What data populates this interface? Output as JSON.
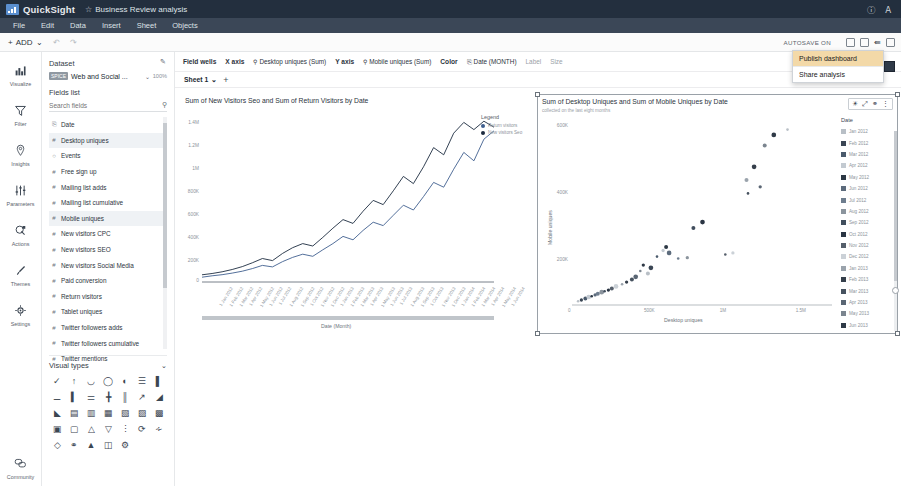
{
  "app": {
    "brand": "QuickSight",
    "doc_title": "Business Review analysis",
    "star_icon": "star-icon",
    "help_icon": "help-icon",
    "account_icon": "account-icon"
  },
  "menubar": {
    "items": [
      {
        "label": "File"
      },
      {
        "label": "Edit"
      },
      {
        "label": "Data"
      },
      {
        "label": "Insert"
      },
      {
        "label": "Sheet"
      },
      {
        "label": "Objects"
      }
    ]
  },
  "toolbar": {
    "add_label": "ADD",
    "add_caret": "⌄",
    "undo_icon": "undo-icon",
    "redo_icon": "redo-icon",
    "autosave_label": "AUTOSAVE ON",
    "icons": [
      "history-icon",
      "pdf-export-icon",
      "share-icon",
      "fullscreen-icon"
    ]
  },
  "share_menu": {
    "items": [
      {
        "label": "Publish dashboard",
        "highlighted": true
      },
      {
        "label": "Share analysis",
        "highlighted": false
      }
    ]
  },
  "rail": {
    "items": [
      {
        "label": "Visualize",
        "icon": "bar-chart-icon",
        "glyph": "ὌA"
      },
      {
        "label": "Filter",
        "icon": "funnel-icon",
        "glyph": "▽"
      },
      {
        "label": "Insights",
        "icon": "lightbulb-pin-icon",
        "glyph": "⦸"
      },
      {
        "label": "Parameters",
        "icon": "sliders-icon",
        "glyph": "⦀"
      },
      {
        "label": "Actions",
        "icon": "cursor-click-icon",
        "glyph": "⊕"
      },
      {
        "label": "Themes",
        "icon": "paintbrush-icon",
        "glyph": "✐"
      },
      {
        "label": "Settings",
        "icon": "gear-icon",
        "glyph": "⚙"
      }
    ],
    "bottom": {
      "label": "Community",
      "icon": "chat-bubbles-icon",
      "glyph": "὞9"
    }
  },
  "panel": {
    "dataset_header": "Dataset",
    "edit_icon": "pencil-icon",
    "dataset_badge": "SPICE",
    "dataset_name": "Web and Social ...",
    "dataset_caret": "⌄",
    "dataset_pct": "100%",
    "fields_header": "Fields list",
    "search_placeholder": "Search fields",
    "search_icon": "search-icon",
    "fields": [
      {
        "label": "Date",
        "type": "date",
        "glyph": "Ὄ5",
        "selected": false
      },
      {
        "label": "Desktop uniques",
        "type": "number",
        "glyph": "#",
        "selected": true
      },
      {
        "label": "Events",
        "type": "string",
        "glyph": "○",
        "selected": false
      },
      {
        "label": "Free sign up",
        "type": "number",
        "glyph": "#",
        "selected": false
      },
      {
        "label": "Mailing list adds",
        "type": "number",
        "glyph": "#",
        "selected": false
      },
      {
        "label": "Mailing list cumulative",
        "type": "number",
        "glyph": "#",
        "selected": false
      },
      {
        "label": "Mobile uniques",
        "type": "number",
        "glyph": "#",
        "selected": true
      },
      {
        "label": "New visitors CPC",
        "type": "number",
        "glyph": "#",
        "selected": false
      },
      {
        "label": "New visitors SEO",
        "type": "number",
        "glyph": "#",
        "selected": false
      },
      {
        "label": "New visitors Social Media",
        "type": "number",
        "glyph": "#",
        "selected": false
      },
      {
        "label": "Paid conversion",
        "type": "number",
        "glyph": "#",
        "selected": false
      },
      {
        "label": "Return visitors",
        "type": "number",
        "glyph": "#",
        "selected": false
      },
      {
        "label": "Tablet uniques",
        "type": "number",
        "glyph": "#",
        "selected": false
      },
      {
        "label": "Twitter followers adds",
        "type": "number",
        "glyph": "#",
        "selected": false
      },
      {
        "label": "Twitter followers cumulative",
        "type": "number",
        "glyph": "#",
        "selected": false
      },
      {
        "label": "Twitter mentions",
        "type": "number",
        "glyph": "#",
        "selected": false
      },
      {
        "label": "Website Pageviews",
        "type": "number",
        "glyph": "#",
        "selected": false
      }
    ],
    "visual_types_header": "Visual types",
    "visual_types_caret": "⌄",
    "visual_type_icons": [
      "autograph-icon",
      "kpi-icon",
      "area-line-icon",
      "pie-icon",
      "donut-icon",
      "bar-horizontal-icon",
      "bar-vertical-icon",
      "bar-stacked-h-icon",
      "bar-stacked-v-icon",
      "bar-100-h-icon",
      "bar-clustered-icon",
      "bar-grouped-icon",
      "line-icon",
      "area-icon",
      "area-stacked-icon",
      "combo-icon",
      "combo-stacked-icon",
      "histogram-icon",
      "pivot-table-icon",
      "table-icon",
      "heat-map-icon",
      "tree-map-icon",
      "geospatial-icon",
      "funnel-icon",
      "funnel-chart-icon",
      "scatter-icon",
      "gauge-icon",
      "word-cloud-icon",
      "sankey-icon",
      "insight-icon",
      "filled-map-icon",
      "box-plot-icon",
      "radar-icon"
    ]
  },
  "field_wells": {
    "title": "Field wells",
    "wells": [
      {
        "label": "X axis",
        "value": "Desktop uniques (Sum)",
        "icon": "number-field-icon"
      },
      {
        "label": "Y axis",
        "value": "Mobile uniques (Sum)",
        "icon": "number-field-icon"
      },
      {
        "label": "Color",
        "value": "Date (MONTH)",
        "icon": "date-field-icon"
      },
      {
        "label": "Label",
        "value": "",
        "icon": ""
      },
      {
        "label": "Size",
        "value": "",
        "icon": ""
      }
    ],
    "collapse_caret": "⌄"
  },
  "sheets": {
    "tabs": [
      {
        "label": "Sheet 1",
        "caret": "⌄",
        "active": true
      }
    ],
    "add_icon": "plus-icon",
    "add_label": "+"
  },
  "chart_data": [
    {
      "id": "line-visual",
      "type": "line",
      "title": "Sum of New Visitors Seo and Sum of Return Visitors by Date",
      "xlabel": "Date (Month)",
      "ylabel": "",
      "ylim": [
        0,
        1400000
      ],
      "yticks": [
        "1.4M",
        "1.2M",
        "1M",
        "800K",
        "600K",
        "400K",
        "200K",
        "0"
      ],
      "grid": false,
      "legend": {
        "position": "right",
        "title": "Legend",
        "entries": [
          {
            "name": "Return visitors",
            "color": "#3f5f8f"
          },
          {
            "name": "New visitors Seo",
            "color": "#1c2b3f"
          }
        ]
      },
      "categories": [
        "1 Jan 2012",
        "1 Feb 2012",
        "1 Mar 2012",
        "1 Apr 2012",
        "1 May 2012",
        "1 Jun 2012",
        "1 Jul 2012",
        "1 Aug 2012",
        "1 Sep 2012",
        "1 Oct 2012",
        "1 Nov 2012",
        "1 Dec 2012",
        "1 Jan 2013",
        "1 Feb 2013",
        "1 Mar 2013",
        "1 Apr 2013",
        "1 May 2013",
        "1 Jun 2013",
        "1 Jul 2013",
        "1 Aug 2013",
        "1 Sep 2013",
        "1 Oct 2013",
        "1 Nov 2013",
        "1 Dec 2013",
        "1 Jan 2014",
        "1 Feb 2014",
        "1 Mar 2014",
        "1 Apr 2014",
        "1 May 2014",
        "1 Jun 2014"
      ],
      "series": [
        {
          "name": "Return visitors",
          "color": "#3f5f8f",
          "values": [
            40000,
            52000,
            61000,
            74000,
            90000,
            112000,
            138000,
            126000,
            170000,
            205000,
            232000,
            214000,
            268000,
            320000,
            380000,
            352000,
            430000,
            498000,
            470000,
            556000,
            640000,
            600000,
            712000,
            830000,
            790000,
            940000,
            1080000,
            1010000,
            1190000,
            1260000
          ]
        },
        {
          "name": "New visitors Seo",
          "color": "#1c2b3f",
          "values": [
            60000,
            71000,
            85000,
            104000,
            128000,
            160000,
            196000,
            178000,
            238000,
            286000,
            320000,
            300000,
            372000,
            448000,
            520000,
            488000,
            590000,
            680000,
            645000,
            760000,
            880000,
            820000,
            960000,
            1120000,
            1060000,
            1240000,
            1330000,
            1270000,
            1340000,
            1290000
          ]
        }
      ]
    },
    {
      "id": "scatter-visual",
      "type": "scatter",
      "title": "Sum of Desktop Uniques and Sum of Mobile Uniques by Date",
      "subtitle": "collected on the last eight months",
      "xlabel": "Desktop uniques",
      "ylabel": "Mobile uniques",
      "xticks": [
        "0",
        "500K",
        "1M",
        "1.5M"
      ],
      "yticks": [
        "600K",
        "400K",
        "200K",
        "0"
      ],
      "xlim": [
        0,
        1700000
      ],
      "ylim": [
        0,
        700000
      ],
      "grid": false,
      "legend": {
        "position": "right",
        "title": "Date"
      },
      "legend_entries": [
        {
          "label": "Jan 2012",
          "color": "#b8bfc6"
        },
        {
          "label": "Feb 2012",
          "color": "#3a4654"
        },
        {
          "label": "Mar 2012",
          "color": "#4a5a6c"
        },
        {
          "label": "Apr 2012",
          "color": "#c3cad1"
        },
        {
          "label": "May 2012",
          "color": "#2d3845"
        },
        {
          "label": "Jun 2012",
          "color": "#5c6b7c"
        },
        {
          "label": "Jul 2012",
          "color": "#6e7d8e"
        },
        {
          "label": "Aug 2012",
          "color": "#8b949d"
        },
        {
          "label": "Sep 2012",
          "color": "#414e5d"
        },
        {
          "label": "Oct 2012",
          "color": "#2a3543"
        },
        {
          "label": "Nov 2012",
          "color": "#555f6b"
        },
        {
          "label": "Dec 2012",
          "color": "#cbd1d7"
        },
        {
          "label": "Jan 2013",
          "color": "#9aa3ac"
        },
        {
          "label": "Feb 2013",
          "color": "#353f4b"
        },
        {
          "label": "Mar 2013",
          "color": "#46525f"
        },
        {
          "label": "Apr 2013",
          "color": "#5a6674"
        },
        {
          "label": "May 2013",
          "color": "#7b858f"
        },
        {
          "label": "Jun 2013",
          "color": "#2f3a47"
        }
      ],
      "points": [
        {
          "x": 40000,
          "y": 14000
        },
        {
          "x": 62000,
          "y": 19000
        },
        {
          "x": 88000,
          "y": 24000
        },
        {
          "x": 110000,
          "y": 30000
        },
        {
          "x": 130000,
          "y": 33000
        },
        {
          "x": 152000,
          "y": 38000
        },
        {
          "x": 170000,
          "y": 42000
        },
        {
          "x": 196000,
          "y": 48000
        },
        {
          "x": 215000,
          "y": 52000
        },
        {
          "x": 240000,
          "y": 56000
        },
        {
          "x": 262000,
          "y": 62000
        },
        {
          "x": 290000,
          "y": 70000
        },
        {
          "x": 330000,
          "y": 78000
        },
        {
          "x": 360000,
          "y": 86000
        },
        {
          "x": 395000,
          "y": 96000
        },
        {
          "x": 420000,
          "y": 106000
        },
        {
          "x": 450000,
          "y": 128000
        },
        {
          "x": 470000,
          "y": 150000
        },
        {
          "x": 500000,
          "y": 118000
        },
        {
          "x": 520000,
          "y": 140000
        },
        {
          "x": 560000,
          "y": 182000
        },
        {
          "x": 600000,
          "y": 205000
        },
        {
          "x": 620000,
          "y": 218000
        },
        {
          "x": 640000,
          "y": 196000
        },
        {
          "x": 700000,
          "y": 175000
        },
        {
          "x": 760000,
          "y": 178000
        },
        {
          "x": 800000,
          "y": 290000
        },
        {
          "x": 860000,
          "y": 312000
        },
        {
          "x": 1010000,
          "y": 190000
        },
        {
          "x": 1060000,
          "y": 196000
        },
        {
          "x": 1150000,
          "y": 470000
        },
        {
          "x": 1200000,
          "y": 520000
        },
        {
          "x": 1160000,
          "y": 420000
        },
        {
          "x": 1240000,
          "y": 445000
        },
        {
          "x": 1270000,
          "y": 600000
        },
        {
          "x": 1330000,
          "y": 640000
        },
        {
          "x": 1420000,
          "y": 660000
        }
      ]
    }
  ]
}
